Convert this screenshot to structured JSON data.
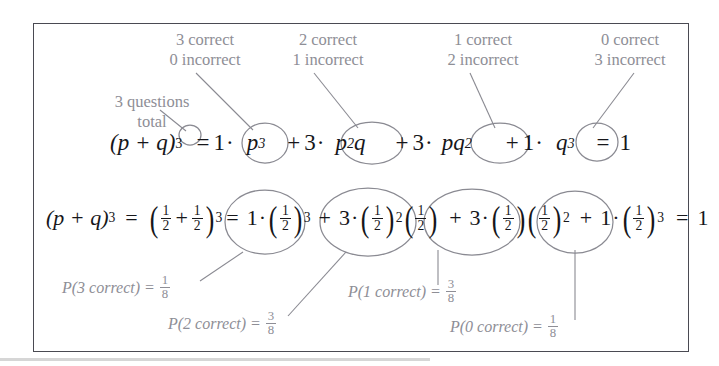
{
  "figure": {
    "border_color": "#4a4a52",
    "annotation_color": "#8e8e96",
    "equation_color": "#16161a",
    "circle_color": "#8a8a92"
  },
  "annotations": {
    "questions_total": {
      "line1": "3 questions",
      "line2": "total"
    },
    "outcomes": [
      {
        "line1": "3 correct",
        "line2": "0 incorrect"
      },
      {
        "line1": "2 correct",
        "line2": "1 incorrect"
      },
      {
        "line1": "1 correct",
        "line2": "2 incorrect"
      },
      {
        "line1": "0 correct",
        "line2": "3 incorrect"
      }
    ]
  },
  "equation_row1": {
    "lhs_base": "(p + q)",
    "lhs_exponent": "3",
    "equals": "=",
    "terms": [
      {
        "coefficient": "1",
        "dot": "·",
        "body_base": "p",
        "body_exp": "3",
        "body_base2": "",
        "body_exp2": ""
      },
      {
        "coefficient": "3",
        "dot": "·",
        "body_base": "p",
        "body_exp": "2",
        "body_base2": "q",
        "body_exp2": ""
      },
      {
        "coefficient": "3",
        "dot": "·",
        "body_base": "p",
        "body_exp": "",
        "body_base2": "q",
        "body_exp2": "2"
      },
      {
        "coefficient": "1",
        "dot": "·",
        "body_base": "q",
        "body_exp": "3",
        "body_base2": "",
        "body_exp2": ""
      }
    ],
    "plus": "+",
    "result": "1"
  },
  "equation_row2": {
    "lhs_base": "(p + q)",
    "lhs_exponent": "3",
    "equals": "=",
    "half_numerator": "1",
    "half_denominator": "2",
    "sum_exponent": "3",
    "plus": "+",
    "dot": "·",
    "terms": [
      {
        "coefficient": "1",
        "exp_a": "3",
        "exp_b": ""
      },
      {
        "coefficient": "3",
        "exp_a": "2",
        "exp_b": ""
      },
      {
        "coefficient": "3",
        "exp_a": "",
        "exp_b": "2"
      },
      {
        "coefficient": "1",
        "exp_a": "3",
        "exp_b": ""
      }
    ],
    "result": "1"
  },
  "probabilities": [
    {
      "label": "P(3 correct) =",
      "num": "1",
      "den": "8"
    },
    {
      "label": "P(2 correct) =",
      "num": "3",
      "den": "8"
    },
    {
      "label": "P(1 correct) =",
      "num": "3",
      "den": "8"
    },
    {
      "label": "P(0 correct) =",
      "num": "1",
      "den": "8"
    }
  ],
  "math_symbols": {
    "equals": "=",
    "plus": "+",
    "dot": "·",
    "lparen": "(",
    "rparen": ")"
  }
}
